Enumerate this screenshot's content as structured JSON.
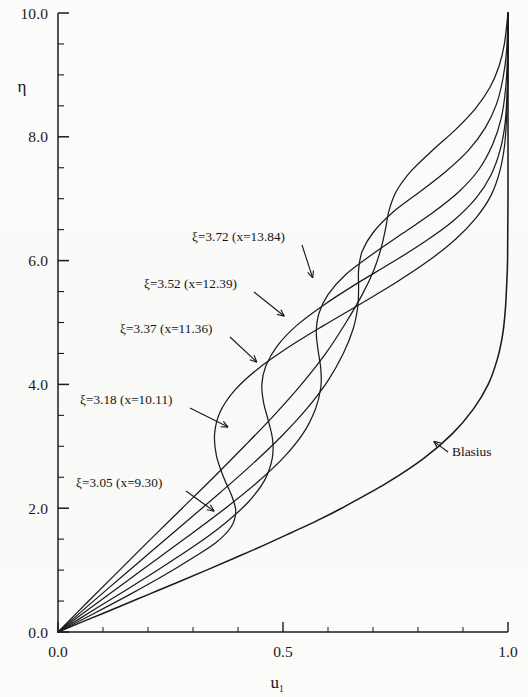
{
  "figure": {
    "background_color": "#fbfbfa",
    "ink_color": "#1b1b1b"
  },
  "axes": {
    "y_axis_title": "η",
    "x_axis_title_base": "u",
    "x_axis_title_sub": "1",
    "y_ticks": [
      "0.0",
      "2.0",
      "4.0",
      "6.0",
      "8.0",
      "10.0"
    ],
    "x_ticks": [
      "0.0",
      "0.5",
      "1.0"
    ]
  },
  "annotations": {
    "blasius_label": "Blasius",
    "curve_labels": [
      "ξ=3.72 (x=13.84)",
      "ξ=3.52 (x=12.39)",
      "ξ=3.37 (x=11.36)",
      "ξ=3.18 (x=10.11)",
      "ξ=3.05 (x=9.30)"
    ]
  },
  "chart_data": {
    "type": "line",
    "title": "",
    "xlabel": "u_1",
    "ylabel": "η",
    "xlim": [
      0.0,
      1.0
    ],
    "ylim": [
      0.0,
      10.0
    ],
    "x_ticks": [
      0.0,
      0.5,
      1.0
    ],
    "y_ticks": [
      0.0,
      2.0,
      4.0,
      6.0,
      8.0,
      10.0
    ],
    "x_minor_tick_step": 0.1,
    "y_minor_tick_step": 0.5,
    "grid": false,
    "legend": "inline-annotations",
    "series": [
      {
        "name": "Blasius",
        "xi": null,
        "x_station": null,
        "points": [
          [
            0.0,
            0.0
          ],
          [
            0.066,
            0.2
          ],
          [
            0.133,
            0.4
          ],
          [
            0.199,
            0.6
          ],
          [
            0.265,
            0.8
          ],
          [
            0.33,
            1.0
          ],
          [
            0.394,
            1.2
          ],
          [
            0.457,
            1.4
          ],
          [
            0.517,
            1.6
          ],
          [
            0.576,
            1.8
          ],
          [
            0.63,
            2.0
          ],
          [
            0.729,
            2.4
          ],
          [
            0.812,
            2.8
          ],
          [
            0.876,
            3.2
          ],
          [
            0.923,
            3.6
          ],
          [
            0.956,
            4.0
          ],
          [
            0.976,
            4.4
          ],
          [
            0.988,
            4.8
          ],
          [
            0.994,
            5.2
          ],
          [
            0.997,
            5.6
          ],
          [
            0.999,
            6.0
          ],
          [
            1.0,
            7.0
          ],
          [
            1.0,
            8.5
          ],
          [
            1.0,
            10.0
          ]
        ]
      },
      {
        "name": "ξ=3.05 (x=9.30)",
        "xi": 3.05,
        "x_station": 9.3,
        "points": [
          [
            0.0,
            0.0
          ],
          [
            0.08,
            0.3
          ],
          [
            0.158,
            0.6
          ],
          [
            0.232,
            0.9
          ],
          [
            0.3,
            1.2
          ],
          [
            0.352,
            1.45
          ],
          [
            0.385,
            1.7
          ],
          [
            0.395,
            1.95
          ],
          [
            0.386,
            2.2
          ],
          [
            0.368,
            2.5
          ],
          [
            0.352,
            2.85
          ],
          [
            0.348,
            3.2
          ],
          [
            0.36,
            3.55
          ],
          [
            0.392,
            3.9
          ],
          [
            0.444,
            4.25
          ],
          [
            0.512,
            4.6
          ],
          [
            0.59,
            4.95
          ],
          [
            0.672,
            5.3
          ],
          [
            0.752,
            5.65
          ],
          [
            0.824,
            6.0
          ],
          [
            0.884,
            6.35
          ],
          [
            0.93,
            6.7
          ],
          [
            0.962,
            7.05
          ],
          [
            0.982,
            7.45
          ],
          [
            0.993,
            7.9
          ],
          [
            0.998,
            8.5
          ],
          [
            1.0,
            9.2
          ],
          [
            1.0,
            10.0
          ]
        ]
      },
      {
        "name": "ξ=3.18 (x=10.11)",
        "xi": 3.18,
        "x_station": 10.11,
        "points": [
          [
            0.0,
            0.0
          ],
          [
            0.078,
            0.35
          ],
          [
            0.156,
            0.7
          ],
          [
            0.232,
            1.05
          ],
          [
            0.305,
            1.4
          ],
          [
            0.37,
            1.75
          ],
          [
            0.423,
            2.1
          ],
          [
            0.459,
            2.45
          ],
          [
            0.476,
            2.8
          ],
          [
            0.477,
            3.1
          ],
          [
            0.468,
            3.4
          ],
          [
            0.457,
            3.7
          ],
          [
            0.453,
            4.0
          ],
          [
            0.462,
            4.3
          ],
          [
            0.487,
            4.62
          ],
          [
            0.53,
            4.95
          ],
          [
            0.59,
            5.28
          ],
          [
            0.662,
            5.62
          ],
          [
            0.74,
            5.96
          ],
          [
            0.814,
            6.3
          ],
          [
            0.878,
            6.64
          ],
          [
            0.928,
            7.0
          ],
          [
            0.962,
            7.38
          ],
          [
            0.983,
            7.8
          ],
          [
            0.994,
            8.25
          ],
          [
            0.999,
            8.9
          ],
          [
            1.0,
            9.5
          ],
          [
            1.0,
            10.0
          ]
        ]
      },
      {
        "name": "ξ=3.37 (x=11.36)",
        "xi": 3.37,
        "x_station": 11.36,
        "points": [
          [
            0.0,
            0.0
          ],
          [
            0.074,
            0.4
          ],
          [
            0.149,
            0.8
          ],
          [
            0.224,
            1.2
          ],
          [
            0.299,
            1.6
          ],
          [
            0.372,
            2.0
          ],
          [
            0.44,
            2.4
          ],
          [
            0.499,
            2.8
          ],
          [
            0.544,
            3.2
          ],
          [
            0.572,
            3.6
          ],
          [
            0.584,
            3.95
          ],
          [
            0.584,
            4.25
          ],
          [
            0.578,
            4.55
          ],
          [
            0.574,
            4.85
          ],
          [
            0.58,
            5.15
          ],
          [
            0.6,
            5.45
          ],
          [
            0.64,
            5.78
          ],
          [
            0.698,
            6.1
          ],
          [
            0.766,
            6.44
          ],
          [
            0.834,
            6.78
          ],
          [
            0.892,
            7.12
          ],
          [
            0.936,
            7.48
          ],
          [
            0.966,
            7.88
          ],
          [
            0.985,
            8.3
          ],
          [
            0.995,
            8.8
          ],
          [
            0.999,
            9.35
          ],
          [
            1.0,
            10.0
          ]
        ]
      },
      {
        "name": "ξ=3.52 (x=12.39)",
        "xi": 3.52,
        "x_station": 12.39,
        "points": [
          [
            0.0,
            0.0
          ],
          [
            0.071,
            0.45
          ],
          [
            0.143,
            0.9
          ],
          [
            0.215,
            1.35
          ],
          [
            0.288,
            1.8
          ],
          [
            0.36,
            2.25
          ],
          [
            0.43,
            2.7
          ],
          [
            0.495,
            3.15
          ],
          [
            0.552,
            3.6
          ],
          [
            0.599,
            4.05
          ],
          [
            0.634,
            4.5
          ],
          [
            0.656,
            4.9
          ],
          [
            0.666,
            5.25
          ],
          [
            0.668,
            5.55
          ],
          [
            0.668,
            5.85
          ],
          [
            0.676,
            6.15
          ],
          [
            0.7,
            6.45
          ],
          [
            0.744,
            6.78
          ],
          [
            0.802,
            7.1
          ],
          [
            0.862,
            7.44
          ],
          [
            0.912,
            7.78
          ],
          [
            0.949,
            8.14
          ],
          [
            0.974,
            8.52
          ],
          [
            0.989,
            8.95
          ],
          [
            0.997,
            9.4
          ],
          [
            1.0,
            10.0
          ]
        ]
      },
      {
        "name": "ξ=3.72 (x=13.84)",
        "xi": 3.72,
        "x_station": 13.84,
        "points": [
          [
            0.0,
            0.0
          ],
          [
            0.068,
            0.5
          ],
          [
            0.137,
            1.0
          ],
          [
            0.206,
            1.5
          ],
          [
            0.276,
            2.0
          ],
          [
            0.346,
            2.5
          ],
          [
            0.414,
            3.0
          ],
          [
            0.48,
            3.5
          ],
          [
            0.541,
            4.0
          ],
          [
            0.595,
            4.5
          ],
          [
            0.64,
            5.0
          ],
          [
            0.676,
            5.45
          ],
          [
            0.702,
            5.85
          ],
          [
            0.718,
            6.2
          ],
          [
            0.728,
            6.52
          ],
          [
            0.736,
            6.82
          ],
          [
            0.752,
            7.12
          ],
          [
            0.784,
            7.44
          ],
          [
            0.832,
            7.78
          ],
          [
            0.884,
            8.12
          ],
          [
            0.928,
            8.46
          ],
          [
            0.96,
            8.8
          ],
          [
            0.98,
            9.14
          ],
          [
            0.992,
            9.5
          ],
          [
            1.0,
            10.0
          ]
        ]
      }
    ],
    "annotation_targets": [
      {
        "label": "ξ=3.72 (x=13.84)",
        "u1": 0.566,
        "eta": 5.72
      },
      {
        "label": "ξ=3.52 (x=12.39)",
        "u1": 0.503,
        "eta": 5.1
      },
      {
        "label": "ξ=3.37 (x=11.36)",
        "u1": 0.442,
        "eta": 4.36
      },
      {
        "label": "ξ=3.18 (x=10.11)",
        "u1": 0.378,
        "eta": 3.31
      },
      {
        "label": "ξ=3.05 (x=9.30)",
        "u1": 0.347,
        "eta": 1.95
      },
      {
        "label": "Blasius",
        "u1": 0.835,
        "eta": 3.08
      }
    ]
  }
}
